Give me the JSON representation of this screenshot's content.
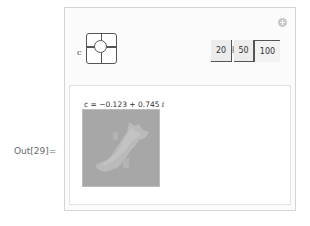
{
  "cell": {
    "out_label": "Out[29]="
  },
  "manipulate": {
    "add_button_icon": "plus-circle-icon",
    "controls": {
      "c": {
        "label": "c",
        "type": "2d-slider",
        "knob_position": [
          0.44,
          0.37
        ]
      },
      "resolution": {
        "label": "resolution",
        "options": [
          "20",
          "50",
          "100"
        ],
        "selected": "100"
      }
    },
    "output": {
      "plot_label_prefix": "c = −0.123 + 0.745",
      "plot_label_imag": "i",
      "image": "julia-set-density-plot",
      "colors": {
        "background": "#a9a9a9",
        "set": "#c4c4c4"
      }
    }
  }
}
